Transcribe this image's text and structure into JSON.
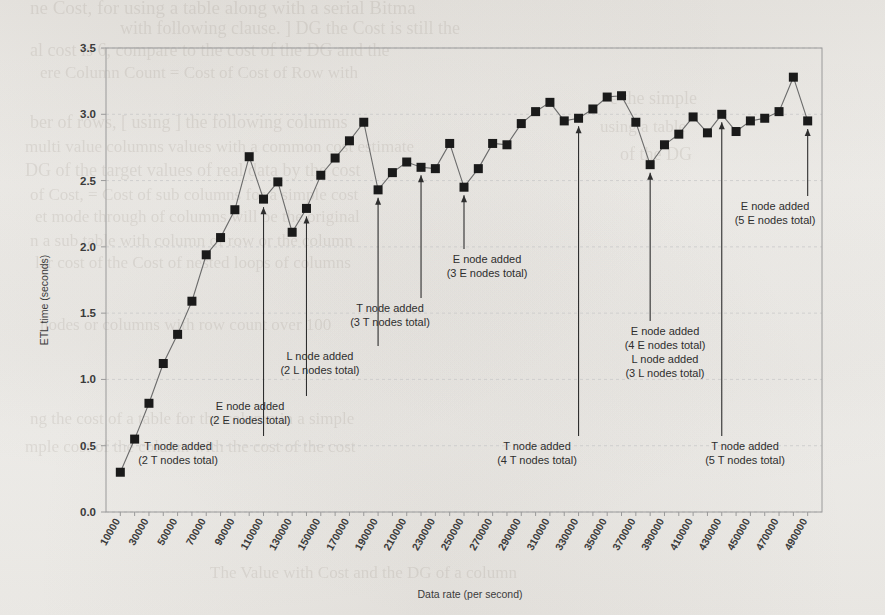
{
  "chart_data": {
    "type": "line",
    "title": "",
    "xlabel": "Data rate (per second)",
    "ylabel": "ETL time (seconds)",
    "xlim": [
      0,
      500000
    ],
    "ylim": [
      0.0,
      3.5
    ],
    "ytick_labels": [
      "0.0",
      "0.5",
      "1.0",
      "1.5",
      "2.0",
      "2.5",
      "3.0",
      "3.5"
    ],
    "ytick_values": [
      0.0,
      0.5,
      1.0,
      1.5,
      2.0,
      2.5,
      3.0,
      3.5
    ],
    "xtick_labels": [
      "10000",
      "30000",
      "50000",
      "70000",
      "90000",
      "110000",
      "130000",
      "150000",
      "170000",
      "190000",
      "210000",
      "230000",
      "250000",
      "270000",
      "290000",
      "310000",
      "330000",
      "350000",
      "370000",
      "390000",
      "410000",
      "430000",
      "450000",
      "470000",
      "490000"
    ],
    "xtick_values": [
      10000,
      30000,
      50000,
      70000,
      90000,
      110000,
      130000,
      150000,
      170000,
      190000,
      210000,
      230000,
      250000,
      270000,
      290000,
      310000,
      330000,
      350000,
      370000,
      390000,
      410000,
      430000,
      450000,
      470000,
      490000
    ],
    "grid": true,
    "legend": "none",
    "marker": "square",
    "series": [
      {
        "name": "ETL time",
        "x": [
          10000,
          20000,
          30000,
          40000,
          50000,
          60000,
          70000,
          80000,
          90000,
          100000,
          110000,
          120000,
          130000,
          140000,
          150000,
          160000,
          170000,
          180000,
          190000,
          200000,
          210000,
          220000,
          230000,
          240000,
          250000,
          260000,
          270000,
          280000,
          290000,
          300000,
          310000,
          320000,
          330000,
          340000,
          350000,
          360000,
          370000,
          380000,
          390000,
          400000,
          410000,
          420000,
          430000,
          440000,
          450000,
          460000,
          470000,
          480000,
          490000
        ],
        "values": [
          0.3,
          0.55,
          0.82,
          1.12,
          1.34,
          1.59,
          1.94,
          2.07,
          2.28,
          2.68,
          2.36,
          2.49,
          2.11,
          2.29,
          2.54,
          2.67,
          2.8,
          2.94,
          2.43,
          2.56,
          2.64,
          2.6,
          2.59,
          2.78,
          2.45,
          2.59,
          2.78,
          2.77,
          2.93,
          3.02,
          3.09,
          2.95,
          2.97,
          3.04,
          3.13,
          3.14,
          2.94,
          2.62,
          2.77,
          2.85,
          2.98,
          2.86,
          3.0,
          2.87,
          2.95,
          2.97,
          3.02,
          3.28,
          2.95
        ]
      }
    ],
    "annotations": [
      {
        "id": "t2",
        "x": 110000,
        "label_lines": [
          "T node added",
          "(2 T nodes total)"
        ],
        "arrow_tip_value": 2.36,
        "text_y_px": 464,
        "text_anchor": "middle",
        "text_x_px": 178
      },
      {
        "id": "e2",
        "x": 140000,
        "label_lines": [
          "E node added",
          "(2 E nodes total)"
        ],
        "arrow_tip_value": 2.29,
        "text_y_px": 424,
        "text_anchor": "middle",
        "text_x_px": 250
      },
      {
        "id": "l2",
        "x": 190000,
        "label_lines": [
          "L node added",
          "(2 L nodes total)"
        ],
        "arrow_tip_value": 2.43,
        "text_y_px": 374,
        "text_anchor": "middle",
        "text_x_px": 320
      },
      {
        "id": "t3",
        "x": 220000,
        "label_lines": [
          "T node added",
          "(3 T nodes total)"
        ],
        "arrow_tip_value": 2.6,
        "text_y_px": 326,
        "text_anchor": "middle",
        "text_x_px": 390
      },
      {
        "id": "e3",
        "x": 250000,
        "label_lines": [
          "E node added",
          "(3 E nodes total)"
        ],
        "arrow_tip_value": 2.45,
        "text_y_px": 277,
        "text_anchor": "middle",
        "text_x_px": 487
      },
      {
        "id": "t4",
        "x": 330000,
        "label_lines": [
          "T node added",
          "(4 T nodes total)"
        ],
        "arrow_tip_value": 2.97,
        "text_y_px": 464,
        "text_anchor": "middle",
        "text_x_px": 537
      },
      {
        "id": "e4l3",
        "x": 380000,
        "label_lines": [
          "E node added",
          "(4 E nodes total)",
          "L node added",
          "(3 L nodes total)"
        ],
        "arrow_tip_value": 2.62,
        "text_y_px": 377,
        "text_anchor": "middle",
        "text_x_px": 665
      },
      {
        "id": "t5",
        "x": 430000,
        "label_lines": [
          "T node added",
          "(5 T nodes total)"
        ],
        "arrow_tip_value": 3.0,
        "text_y_px": 464,
        "text_anchor": "middle",
        "text_x_px": 745
      },
      {
        "id": "e5",
        "x": 490000,
        "label_lines": [
          "E node added",
          "(5 E nodes total)"
        ],
        "arrow_tip_value": 2.95,
        "text_y_px": 224,
        "text_anchor": "middle",
        "text_x_px": 775
      }
    ],
    "colors": {
      "marker": "#1a1a1a",
      "line": "#6b6b6b",
      "grid": "#c9c9c9",
      "frame": "#9a9a9a",
      "text": "#2e2e2e",
      "background": "#f3f2ef"
    }
  }
}
